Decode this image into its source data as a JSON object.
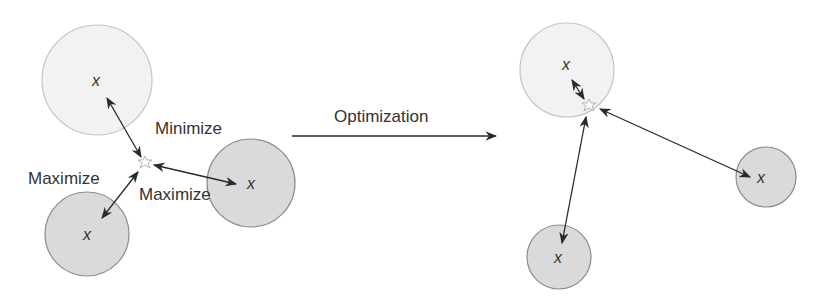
{
  "diagram": {
    "colors": {
      "light_fill": "#f2f2f2",
      "light_stroke": "#c4c4c4",
      "dark_fill": "#dadada",
      "dark_stroke": "#8c8c8c",
      "arrow": "#2a2a2a",
      "text": "#333333"
    },
    "before": {
      "circles": [
        {
          "kind": "light",
          "cx": 97,
          "cy": 80,
          "r": 55,
          "marker": "x"
        },
        {
          "kind": "dark",
          "cx": 87,
          "cy": 234,
          "r": 42,
          "marker": "x"
        },
        {
          "kind": "dark",
          "cx": 251,
          "cy": 183,
          "r": 44,
          "marker": "x"
        }
      ],
      "star": {
        "cx": 145,
        "cy": 163
      },
      "labels": {
        "minimize": "Minimize",
        "maximize_left": "Maximize",
        "maximize_right": "Maximize"
      }
    },
    "transition": {
      "label": "Optimization"
    },
    "after": {
      "circles": [
        {
          "kind": "light",
          "cx": 567,
          "cy": 70,
          "r": 47,
          "marker": "x"
        },
        {
          "kind": "dark",
          "cx": 766,
          "cy": 177,
          "r": 30,
          "marker": "x"
        },
        {
          "kind": "dark",
          "cx": 559,
          "cy": 257,
          "r": 32,
          "marker": "x"
        }
      ],
      "star": {
        "cx": 589,
        "cy": 106
      }
    },
    "marker_glyph": "x"
  }
}
